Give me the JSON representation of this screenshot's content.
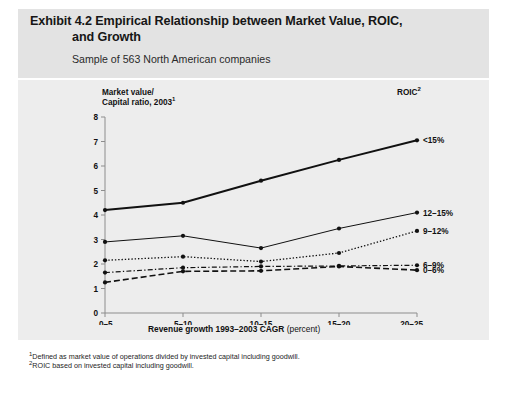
{
  "exhibit": {
    "title_line1": "Exhibit 4.2 Empirical Relationship between Market Value, ROIC,",
    "title_line2": "and Growth",
    "subtitle": "Sample of 563 North American companies",
    "yaxis_caption_line1": "Market value/",
    "yaxis_caption_line2": "Capital ratio, 2003",
    "yaxis_caption_sup": "1",
    "legend_caption": "ROIC",
    "legend_caption_sup": "2",
    "xaxis_title": "Revenue growth 1993–2003 CAGR",
    "xaxis_unit": "(percent)",
    "footnote_1_sup": "1",
    "footnote_1": "Defined as market value of operations divided by invested capital including goodwill.",
    "footnote_2_sup": "2",
    "footnote_2": "ROIC based on invested capital including goodwill."
  },
  "colors": {
    "panel_background": "#ededed",
    "header_background": "#e3e3e3",
    "page_background": "#ffffff",
    "line": "#111111",
    "axis": "#8d8d8d",
    "text": "#111111"
  },
  "chart_data": {
    "type": "line",
    "title": "Exhibit 4.2 Empirical Relationship between Market Value, ROIC, and Growth",
    "subtitle": "Sample of 563 North American companies",
    "xlabel": "Revenue growth 1993–2003 CAGR (percent)",
    "ylabel": "Market value/Capital ratio, 2003",
    "categories": [
      "0–5",
      "5–10",
      "10–15",
      "15–20",
      "20–25"
    ],
    "ylim": [
      0,
      8
    ],
    "yticks": [
      0,
      1,
      2,
      3,
      4,
      5,
      6,
      7,
      8
    ],
    "ytick_labels": [
      "0",
      "1",
      "2",
      "3",
      "4",
      "5",
      "6",
      "7",
      "8"
    ],
    "grid": false,
    "legend_position": "right-of-plot-at-line-end",
    "legend_title": "ROIC",
    "markers": true,
    "series": [
      {
        "name": "<15%",
        "label": "<15%",
        "style": "solid-thick",
        "values": [
          4.2,
          4.5,
          5.4,
          6.25,
          7.05
        ]
      },
      {
        "name": "12–15%",
        "label": "12–15%",
        "style": "solid-thin",
        "values": [
          2.9,
          3.15,
          2.65,
          3.45,
          4.1
        ]
      },
      {
        "name": "9–12%",
        "label": "9–12%",
        "style": "dotted",
        "values": [
          2.15,
          2.3,
          2.1,
          2.45,
          3.35
        ]
      },
      {
        "name": "6–9%",
        "label": "6–9%",
        "style": "dash-dot",
        "values": [
          1.65,
          1.85,
          1.9,
          1.92,
          1.95
        ]
      },
      {
        "name": "0–6%",
        "label": "0–6%",
        "style": "dashed",
        "values": [
          1.25,
          1.7,
          1.72,
          1.9,
          1.75
        ]
      }
    ]
  }
}
